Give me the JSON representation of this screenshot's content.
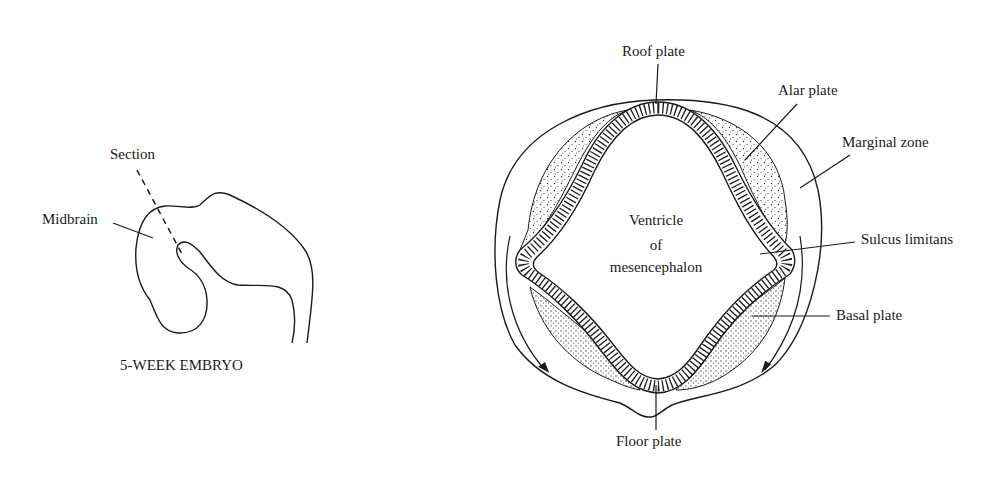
{
  "figure": {
    "left_panel": {
      "caption": "5-WEEK EMBRYO",
      "labels": {
        "section": "Section",
        "midbrain": "Midbrain"
      }
    },
    "right_panel": {
      "labels": {
        "roof_plate": "Roof plate",
        "alar_plate": "Alar plate",
        "marginal_zone": "Marginal zone",
        "ventricle_line1": "Ventricle",
        "ventricle_line2": "of",
        "ventricle_line3": "mesencephalon",
        "sulcus_limitans": "Sulcus limitans",
        "basal_plate": "Basal plate",
        "floor_plate": "Floor plate"
      }
    },
    "colors": {
      "ink": "#1a1a1a",
      "background": "#ffffff"
    }
  }
}
